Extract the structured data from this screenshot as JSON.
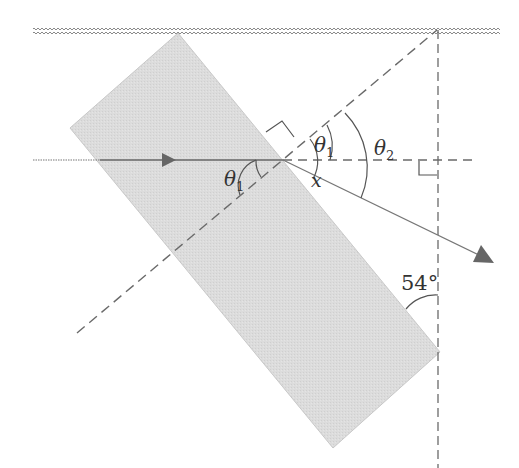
{
  "diagram": {
    "title": "",
    "type": "refraction through a tilted glass slab",
    "colors": {
      "background": "#ffffff",
      "slab_fill": "#d9d9d9",
      "slab_edge": "#c8c8c8",
      "line": "#555555",
      "dashed": "#6a6a6a",
      "surface_zigzag": "#8a8a8a",
      "arrow": "#666666",
      "label": "#333333"
    },
    "surface": {
      "label": "",
      "style": "zigzag",
      "y": 30,
      "x_start": 33,
      "x_end": 500
    },
    "slab": {
      "label": "",
      "corners": [
        [
          178,
          33
        ],
        [
          440,
          352
        ],
        [
          333,
          448
        ],
        [
          70,
          128
        ]
      ]
    },
    "incident_ray": {
      "from": [
        33,
        160
      ],
      "to": [
        283,
        160
      ],
      "arrow_at": [
        172,
        160
      ]
    },
    "refracted_ray": {
      "from": [
        283,
        160
      ],
      "to": [
        493,
        262
      ]
    },
    "normal_line": {
      "from": [
        77,
        333
      ],
      "to": [
        437,
        30
      ],
      "style": "dashed"
    },
    "vertical_line": {
      "x": 438,
      "y_start": 30,
      "y_end": 468,
      "style": "dashed"
    },
    "horizontal_ref_line": {
      "from": [
        283,
        160
      ],
      "to": [
        478,
        160
      ],
      "style": "dashed"
    },
    "labels": {
      "theta1_inside": {
        "symbol": "θ",
        "subscript": "1"
      },
      "theta1_outside": {
        "symbol": "θ",
        "subscript": "1"
      },
      "theta2": {
        "symbol": "θ",
        "subscript": "2"
      },
      "x_angle": "x",
      "angle_54": "54°"
    }
  }
}
